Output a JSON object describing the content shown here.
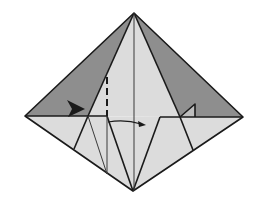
{
  "diagram": {
    "title": "Origami fold step: squash/inside-reverse fold diagram",
    "colors": {
      "background": "#ffffff",
      "dark_face": "#8e8e8e",
      "light_face": "#dcdcdc",
      "line": "#1a1a1a",
      "thin_line": "#3a3a3a"
    },
    "points": {
      "top": [
        134,
        13
      ],
      "left": [
        25,
        116
      ],
      "right": [
        243,
        117
      ],
      "bottom": [
        133,
        191
      ]
    },
    "annotations": {
      "push_arrow": "arrowhead pointing right (push in)",
      "fold_arrow": "curved arrow pointing right (fold over)",
      "valley_fold_line": "dashed vertical line"
    }
  }
}
